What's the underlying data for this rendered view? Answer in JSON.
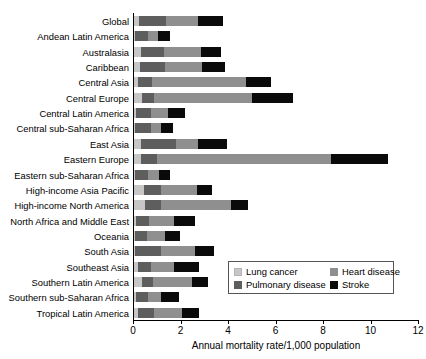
{
  "top_caption": "",
  "chart_data": {
    "type": "bar",
    "orientation": "horizontal",
    "stacked": true,
    "title": "",
    "xlabel": "Annual mortality rate/1,000 population",
    "ylabel": "",
    "xlim": [
      0,
      12
    ],
    "xticks": [
      0,
      2,
      4,
      6,
      8,
      10,
      12
    ],
    "xtick_labels": [
      "0",
      "2",
      "4",
      "6",
      "8",
      "10",
      "12"
    ],
    "grid": false,
    "legend_position": "lower-right-inside",
    "categories": [
      "Global",
      "Andean Latin America",
      "Australasia",
      "Caribbean",
      "Central Asia",
      "Central Europe",
      "Central Latin America",
      "Central sub-Saharan Africa",
      "East Asia",
      "Eastern Europe",
      "Eastern sub-Saharan Africa",
      "High-income Asia Pacific",
      "High-income North America",
      "North Africa and Middle East",
      "Oceania",
      "South Asia",
      "Southeast Asia",
      "Southern Latin America",
      "Southern sub-Saharan Africa",
      "Tropical Latin America"
    ],
    "series": [
      {
        "name": "Lung cancer",
        "color": "#c6c6c6",
        "values": [
          0.2,
          0.05,
          0.3,
          0.25,
          0.15,
          0.35,
          0.1,
          0.05,
          0.3,
          0.3,
          0.05,
          0.4,
          0.45,
          0.1,
          0.05,
          0.05,
          0.15,
          0.35,
          0.1,
          0.15
        ]
      },
      {
        "name": "Pulmonary disease",
        "color": "#5e5e5e",
        "values": [
          1.15,
          0.55,
          0.95,
          1.05,
          0.6,
          0.5,
          0.6,
          0.65,
          1.45,
          0.65,
          0.55,
          0.75,
          0.7,
          0.55,
          0.5,
          1.1,
          0.55,
          0.45,
          0.5,
          0.7
        ]
      },
      {
        "name": "Heart disease",
        "color": "#8f8f8f",
        "values": [
          1.35,
          0.4,
          1.55,
          1.55,
          3.95,
          4.1,
          0.75,
          0.45,
          0.95,
          7.35,
          0.45,
          1.5,
          2.95,
          1.05,
          0.75,
          1.4,
          1.0,
          1.65,
          0.55,
          1.15
        ]
      },
      {
        "name": "Stroke",
        "color": "#0a0a0a",
        "values": [
          1.05,
          0.5,
          0.85,
          1.0,
          1.05,
          1.75,
          0.7,
          0.5,
          1.2,
          2.4,
          0.45,
          0.65,
          0.7,
          0.85,
          0.65,
          0.8,
          1.05,
          0.65,
          0.75,
          0.75
        ]
      }
    ],
    "totals": [
      3.75,
      1.5,
      3.65,
      3.85,
      5.75,
      6.7,
      2.15,
      1.65,
      3.9,
      10.7,
      1.5,
      3.3,
      4.8,
      2.55,
      1.95,
      3.35,
      2.75,
      3.1,
      1.9,
      2.75
    ]
  },
  "legend": {
    "entries": [
      {
        "label": "Lung cancer",
        "swatch": "sw-lung"
      },
      {
        "label": "Heart disease",
        "swatch": "sw-heart"
      },
      {
        "label": "Pulmonary disease",
        "swatch": "sw-pulm"
      },
      {
        "label": "Stroke",
        "swatch": "sw-stroke"
      }
    ]
  }
}
